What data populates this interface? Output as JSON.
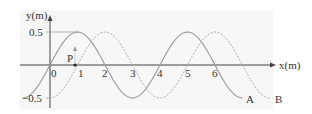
{
  "chart_data": {
    "type": "line",
    "title": "",
    "xlabel": "x(m)",
    "ylabel": "y(m)",
    "xticks": [
      "0",
      "1",
      "2",
      "3",
      "4",
      "5",
      "6"
    ],
    "yticks": [
      "0.5",
      "-0.5"
    ],
    "xlim": [
      -1.2,
      8.2
    ],
    "ylim": [
      -0.6,
      0.6
    ],
    "grid": false,
    "series": [
      {
        "name": "A",
        "style": "solid",
        "color": "#999999",
        "amplitude": 0.5,
        "wavelength": 4,
        "phase_shift": 0,
        "x": [
          -1,
          0,
          1,
          2,
          3,
          4,
          5,
          6,
          7
        ],
        "y": [
          -0.5,
          0,
          0.5,
          0,
          -0.5,
          0,
          0.5,
          0,
          -0.5
        ]
      },
      {
        "name": "B",
        "style": "dashed",
        "color": "#aaaaaa",
        "amplitude": 0.5,
        "wavelength": 4,
        "phase_shift": 1,
        "x": [
          0,
          1,
          2,
          3,
          4,
          5,
          6,
          7,
          8
        ],
        "y": [
          -0.5,
          0,
          0.5,
          0,
          -0.5,
          0,
          0.5,
          0,
          -0.5
        ]
      }
    ],
    "annotations": [
      {
        "label": "P",
        "x": 0.9,
        "y": 0,
        "note": "point with upward arrow"
      }
    ]
  },
  "labels": {
    "yaxis": "y(m)",
    "xaxis": "x(m)",
    "y_pos": "0.5",
    "y_neg": "−0.5",
    "origin": "0",
    "t1": "1",
    "t2": "2",
    "t3": "3",
    "t4": "4",
    "t5": "5",
    "t6": "6",
    "point": "P",
    "curveA": "A",
    "curveB": "B"
  }
}
